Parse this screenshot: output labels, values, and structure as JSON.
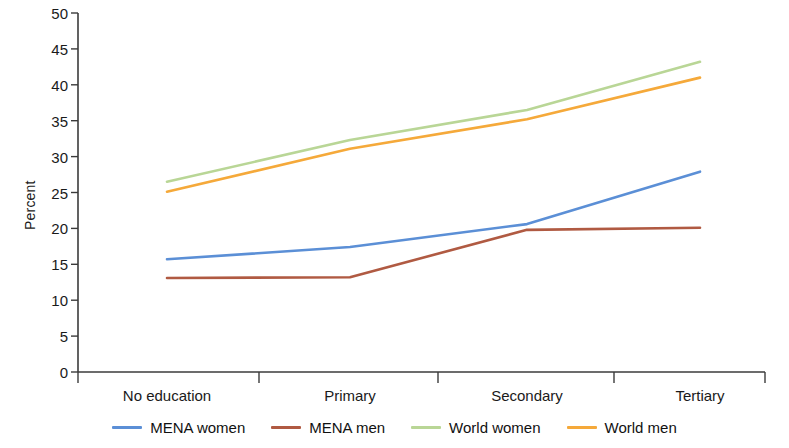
{
  "chart_data": {
    "type": "line",
    "title": "",
    "xlabel": "",
    "ylabel": "Percent",
    "categories": [
      "No education",
      "Primary",
      "Secondary",
      "Tertiary"
    ],
    "ylim": [
      0,
      50
    ],
    "yticks": [
      0,
      5,
      10,
      15,
      20,
      25,
      30,
      35,
      40,
      45,
      50
    ],
    "grid": false,
    "legend_position": "bottom",
    "series": [
      {
        "name": "MENA women",
        "color": "#5b8fd6",
        "values": [
          15.7,
          17.4,
          20.6,
          27.9
        ]
      },
      {
        "name": "MENA men",
        "color": "#b05a42",
        "values": [
          13.1,
          13.2,
          19.8,
          20.1
        ]
      },
      {
        "name": "World women",
        "color": "#b9d696",
        "values": [
          26.5,
          32.3,
          36.5,
          43.2
        ]
      },
      {
        "name": "World men",
        "color": "#f5a93a",
        "values": [
          25.1,
          31.1,
          35.2,
          41.0
        ]
      }
    ]
  },
  "axis": {
    "y_title": "Percent",
    "y_tick_labels": [
      "50",
      "45",
      "40",
      "35",
      "30",
      "25",
      "20",
      "15",
      "10",
      "5",
      "0"
    ],
    "x_tick_labels": [
      "No education",
      "Primary",
      "Secondary",
      "Tertiary"
    ]
  },
  "legend": {
    "items": [
      {
        "label": "MENA women",
        "color": "#5b8fd6"
      },
      {
        "label": "MENA men",
        "color": "#b05a42"
      },
      {
        "label": "World women",
        "color": "#b9d696"
      },
      {
        "label": "World men",
        "color": "#f5a93a"
      }
    ]
  }
}
